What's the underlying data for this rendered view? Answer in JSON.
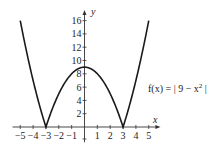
{
  "chart_data": {
    "type": "line",
    "title": "",
    "function_label": "f(x) = | 9 − x² |",
    "xlabel": "x",
    "ylabel": "y",
    "xlim": [
      -5,
      5
    ],
    "ylim": [
      0,
      16
    ],
    "x_ticks": [
      -5,
      -4,
      -3,
      -2,
      -1,
      1,
      2,
      3,
      4,
      5
    ],
    "y_ticks": [
      2,
      4,
      6,
      8,
      10,
      12,
      14,
      16
    ],
    "grid": false,
    "legend": "none",
    "series": [
      {
        "name": "f(x) = |9 - x^2|",
        "x": [
          -5,
          -4.5,
          -4,
          -3.5,
          -3,
          -2.5,
          -2,
          -1.5,
          -1,
          -0.5,
          0,
          0.5,
          1,
          1.5,
          2,
          2.5,
          3,
          3.5,
          4,
          4.5,
          5
        ],
        "values": [
          16,
          11.25,
          7,
          3.25,
          0,
          2.75,
          5,
          6.75,
          8,
          8.75,
          9,
          8.75,
          8,
          6.75,
          5,
          2.75,
          0,
          3.25,
          7,
          11.25,
          16
        ]
      }
    ],
    "annotations": [
      {
        "text": "f(x) = | 9 − x² |",
        "position": "right of curve near y≈6"
      }
    ]
  },
  "labels": {
    "x_axis": "x",
    "y_axis": "y",
    "fn_main": "f(x) = | 9 − x",
    "fn_sup": "2",
    "fn_end": " |"
  },
  "colors": {
    "curve": "#1a1a1a",
    "axis": "#333333"
  }
}
